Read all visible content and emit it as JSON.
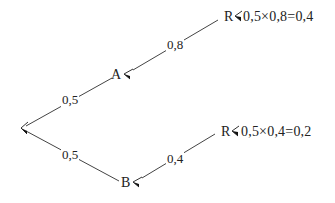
{
  "diagram": {
    "type": "probability-tree",
    "root": {
      "label": ""
    },
    "branches": [
      {
        "from": "root",
        "to": "A",
        "probability": "0,5",
        "children": [
          {
            "from": "A",
            "to": "R",
            "probability": "0,8",
            "result": "0,5×0,8=0,4"
          }
        ]
      },
      {
        "from": "root",
        "to": "B",
        "probability": "0,5",
        "children": [
          {
            "from": "B",
            "to": "R",
            "probability": "0,4",
            "result": "0,5×0,4=0,2"
          }
        ]
      }
    ]
  },
  "labels": {
    "node_a": "A",
    "node_b": "B",
    "node_r_top": "R",
    "node_r_bottom": "R",
    "edge_root_a": "0,5",
    "edge_root_b": "0,5",
    "edge_a_r": "0,8",
    "edge_b_r": "0,4",
    "calc_top": "0,5×0,8=0,4",
    "calc_bottom": "0,5×0,4=0,2"
  },
  "colors": {
    "line": "#333333",
    "text": "#222222",
    "background": "#ffffff"
  }
}
